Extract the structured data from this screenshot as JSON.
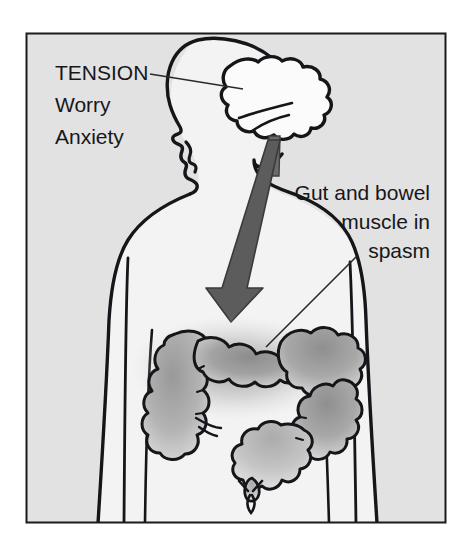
{
  "figure": {
    "frame": {
      "x": 26,
      "y": 33,
      "width": 420,
      "height": 490,
      "border_color": "#1b1b1b"
    },
    "colors": {
      "background": "#e2e2e2",
      "body_fill": "#f2f2f2",
      "outline": "#16161a",
      "arrow_fill": "#5c5c5c",
      "gut_shade": "#9c9c9c",
      "gut_shade_light": "#bdbdbd",
      "brain_fill": "#fbfbfb",
      "text": "#17171a",
      "leader_line": "#2a2a2a"
    }
  },
  "labels": {
    "tension": {
      "lines": [
        "TENSION",
        "Worry",
        "Anxiety"
      ],
      "line1": "TENSION",
      "line2": "Worry",
      "line3": "Anxiety",
      "font_size": 21,
      "anchor": "start",
      "x": 55,
      "y": 80,
      "leader": {
        "from_x": 150,
        "from_y": 74,
        "to_x": 243,
        "to_y": 89
      }
    },
    "gut": {
      "lines": [
        "Gut and bowel",
        "muscle in",
        "spasm"
      ],
      "line1": "Gut and bowel",
      "line2": "muscle in",
      "line3": "spasm",
      "font_size": 21,
      "anchor": "end",
      "x": 430,
      "y": 200,
      "leader": {
        "from_x": 357,
        "from_y": 256,
        "to_x": 266,
        "to_y": 347
      }
    }
  },
  "anatomy": {
    "head": {
      "name": "head-profile-facing-left"
    },
    "brain": {
      "name": "brain",
      "fill": "#fbfbfb"
    },
    "brain_stem": {
      "name": "brain-stem"
    },
    "torso": {
      "name": "torso-silhouette"
    },
    "arrow": {
      "name": "downward-stress-arrow",
      "direction": "down",
      "from": "brain",
      "to": "gut",
      "tip_x": 231,
      "tip_y": 322
    },
    "colon": {
      "name": "large-intestine-colon",
      "state": "spasm",
      "segments": [
        "ascending",
        "hepatic-flexure",
        "transverse",
        "splenic-flexure",
        "descending",
        "sigmoid",
        "rectum"
      ]
    }
  }
}
